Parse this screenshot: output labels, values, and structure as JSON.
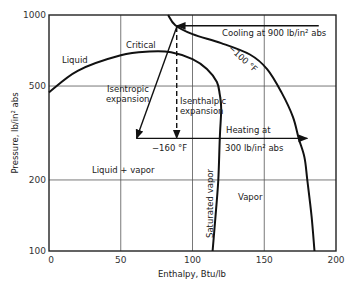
{
  "chart_data": {
    "type": "line",
    "title": "",
    "xlabel": "Enthalpy, Btu/lb",
    "ylabel": "Pressure, lb/in² abs",
    "xlim": [
      0,
      200
    ],
    "ylim": [
      100,
      1000
    ],
    "yscale": "log",
    "grid": true,
    "x_ticks": [
      0,
      50,
      100,
      150,
      200
    ],
    "y_ticks": [
      100,
      200,
      500,
      1000
    ],
    "x_tick_labels": [
      "0",
      "50",
      "100",
      "150",
      "200"
    ],
    "y_tick_labels": [
      "100",
      "200",
      "500",
      "1000"
    ],
    "series": [
      {
        "name": "Saturation dome (liquid + saturated vapor)",
        "points": [
          [
            0,
            470
          ],
          [
            20,
            580
          ],
          [
            50,
            675
          ],
          [
            70,
            700
          ],
          [
            85,
            695
          ],
          [
            100,
            650
          ],
          [
            110,
            590
          ],
          [
            117,
            520
          ],
          [
            119,
            460
          ],
          [
            120,
            400
          ],
          [
            119,
            300
          ],
          [
            118,
            200
          ],
          [
            116,
            140
          ],
          [
            114,
            100
          ]
        ]
      },
      {
        "name": "-100 °F isotherm",
        "points": [
          [
            83,
            1000
          ],
          [
            88,
            905
          ],
          [
            100,
            830
          ],
          [
            120,
            760
          ],
          [
            140,
            680
          ],
          [
            152,
            590
          ],
          [
            162,
            470
          ],
          [
            170,
            370
          ],
          [
            174,
            300
          ],
          [
            178,
            250
          ],
          [
            180,
            200
          ],
          [
            183,
            140
          ],
          [
            185,
            100
          ]
        ]
      }
    ],
    "processes": [
      {
        "name": "Cooling at 900 lb/in² abs",
        "from": [
          188,
          900
        ],
        "to": [
          89,
          900
        ],
        "style": "solid-arrow"
      },
      {
        "name": "Isentropic expansion",
        "from": [
          89,
          890
        ],
        "to": [
          61,
          300
        ],
        "style": "solid-arrow"
      },
      {
        "name": "Isenthalpic expansion",
        "from": [
          89,
          890
        ],
        "to": [
          89,
          300
        ],
        "style": "dashed-arrow"
      },
      {
        "name": "-160 °F line at 300 lb/in² abs",
        "from": [
          61,
          300
        ],
        "to": [
          89,
          300
        ],
        "style": "solid"
      },
      {
        "name": "Heating at 300 lb/in² abs",
        "from": [
          89,
          300
        ],
        "to": [
          180,
          300
        ],
        "style": "solid-arrow"
      }
    ],
    "annotations": {
      "critical": "Critical",
      "liquid": "Liquid",
      "liquid_vapor": "Liquid + vapor",
      "vapor": "Vapor",
      "saturated_vapor": "Saturated vapor",
      "isotherm_100": "−100 °F",
      "isotherm_160": "−160 °F",
      "isentropic_1": "Isentropic",
      "isentropic_2": "expansion",
      "isenthalpic_1": "Isenthalpic",
      "isenthalpic_2": "expansion",
      "cooling": "Cooling at 900 lb/in² abs",
      "heating_1": "Heating at",
      "heating_2": "300 lb/in² abs"
    }
  }
}
